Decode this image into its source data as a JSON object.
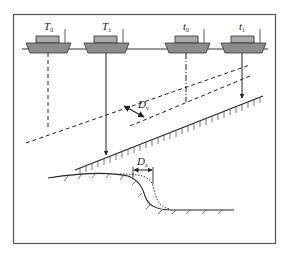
{
  "diagram": {
    "type": "survey-ship-displacement-diagram",
    "colors": {
      "frame": "#555555",
      "line": "#222222",
      "hull": "#8c8c8c",
      "cabin": "#a9a9a9"
    },
    "ships": [
      {
        "id": "T0",
        "label": "T",
        "subscript": "0",
        "line_style": "dashed"
      },
      {
        "id": "T1",
        "label": "T",
        "subscript": "1",
        "line_style": "solid-arrow"
      },
      {
        "id": "t0",
        "label": "t",
        "subscript": "0",
        "line_style": "dash-dot"
      },
      {
        "id": "t1",
        "label": "t",
        "subscript": "1",
        "line_style": "solid-arrow"
      }
    ],
    "annotations": [
      {
        "id": "Dv",
        "label": "D",
        "subscript": "v",
        "meaning": "perpendicular displacement between dashed and solid seabed lines"
      },
      {
        "id": "Dh",
        "label": "D",
        "subscript": "a",
        "meaning": "horizontal offset between solid and dotted slope profiles"
      }
    ]
  }
}
